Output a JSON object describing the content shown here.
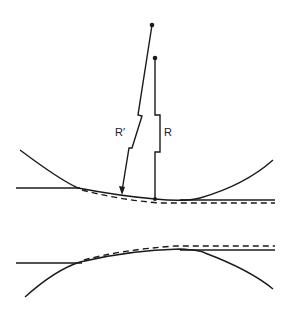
{
  "figure": {
    "labels": {
      "r_prime": "R′",
      "r": "R"
    },
    "colors": {
      "stroke": "#1a1a1a",
      "background": "#ffffff"
    }
  }
}
